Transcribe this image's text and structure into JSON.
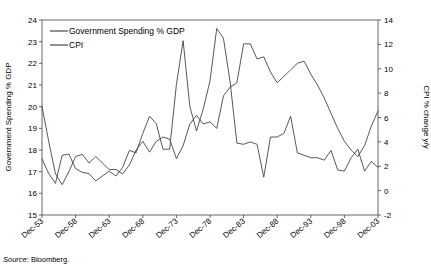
{
  "chart_data": {
    "type": "line",
    "title": "",
    "source": "Source: Bloomberg.",
    "source_prefix": "Source:",
    "source_value": " Bloomberg.",
    "grid": false,
    "legend_position": "top-left",
    "xlabel": "",
    "x_tick_labels": [
      "Dec-53",
      "Dec-58",
      "Dec-63",
      "Dec-68",
      "Dec-73",
      "Dec-78",
      "Dec-83",
      "Dec-88",
      "Dec-93",
      "Dec-98",
      "Dec-03"
    ],
    "x_tick_years": [
      1953,
      1958,
      1963,
      1968,
      1973,
      1978,
      1983,
      1988,
      1993,
      1998,
      2003
    ],
    "xlim": [
      1953,
      2003
    ],
    "left_axis": {
      "label": "Government Spending % GDP",
      "ylim": [
        15,
        24
      ],
      "ticks": [
        15,
        16,
        17,
        18,
        19,
        20,
        21,
        22,
        23,
        24
      ],
      "tick_labels": [
        "15",
        "16",
        "17",
        "18",
        "19",
        "20",
        "21",
        "22",
        "23",
        "24"
      ]
    },
    "right_axis": {
      "label": "CPI % change y/y",
      "ylim": [
        -2,
        14
      ],
      "ticks": [
        -2,
        0,
        2,
        4,
        6,
        8,
        10,
        12,
        14
      ],
      "tick_labels": [
        "-2",
        "0",
        "2",
        "4",
        "6",
        "8",
        "10",
        "12",
        "14"
      ]
    },
    "series": [
      {
        "name": "Government Spending % GDP",
        "axis": "left",
        "color": "#3a3a3a",
        "x": [
          1953,
          1954,
          1955,
          1956,
          1957,
          1958,
          1959,
          1960,
          1961,
          1962,
          1963,
          1964,
          1965,
          1966,
          1967,
          1968,
          1969,
          1970,
          1971,
          1972,
          1973,
          1974,
          1975,
          1976,
          1977,
          1978,
          1979,
          1980,
          1981,
          1982,
          1983,
          1984,
          1985,
          1986,
          1987,
          1988,
          1989,
          1990,
          1991,
          1992,
          1993,
          1994,
          1995,
          1996,
          1997,
          1998,
          1999,
          2000,
          2001,
          2002,
          2003
        ],
        "values": [
          20.0,
          18.4,
          16.9,
          16.4,
          17.0,
          17.7,
          17.8,
          17.4,
          17.7,
          17.4,
          17.1,
          17.1,
          16.9,
          17.3,
          18.0,
          18.4,
          17.9,
          18.4,
          18.6,
          18.5,
          17.6,
          18.2,
          19.2,
          19.6,
          19.2,
          19.3,
          19.0,
          20.5,
          20.9,
          21.1,
          22.9,
          22.9,
          22.2,
          22.3,
          21.6,
          21.1,
          21.4,
          21.7,
          22.0,
          22.1,
          21.5,
          21.0,
          20.4,
          19.7,
          19.0,
          18.4,
          18.0,
          17.7,
          18.2,
          19.1,
          19.8
        ],
        "notes": "Left-scale series. Starts near 20 in 1953, falls to ~16.4 by 1956, drifts 17-18.5 through the 1960s, rises through the 1970s, peaks ~23 in the early-to-mid 1980s, declines through the 1990s to ~17.7 around 2000, then rises to ~19.8 by 2003."
      },
      {
        "name": "CPI",
        "axis": "right",
        "color": "#3a3a3a",
        "x": [
          1953,
          1954,
          1955,
          1956,
          1957,
          1958,
          1959,
          1960,
          1961,
          1962,
          1963,
          1964,
          1965,
          1966,
          1967,
          1968,
          1969,
          1970,
          1971,
          1972,
          1973,
          1974,
          1975,
          1976,
          1977,
          1978,
          1979,
          1980,
          1981,
          1982,
          1983,
          1984,
          1985,
          1986,
          1987,
          1988,
          1989,
          1990,
          1991,
          1992,
          1993,
          1994,
          1995,
          1996,
          1997,
          1998,
          1999,
          2000,
          2001,
          2002,
          2003
        ],
        "values": [
          2.6,
          1.4,
          0.6,
          2.9,
          3.0,
          1.8,
          1.5,
          1.4,
          0.8,
          1.2,
          1.6,
          1.2,
          1.9,
          3.3,
          3.1,
          4.7,
          6.1,
          5.5,
          3.4,
          3.4,
          8.7,
          12.3,
          6.9,
          4.9,
          6.7,
          9.0,
          13.3,
          12.5,
          8.9,
          3.9,
          3.8,
          4.0,
          3.8,
          1.1,
          4.4,
          4.4,
          4.7,
          6.1,
          3.1,
          2.9,
          2.7,
          2.7,
          2.5,
          3.3,
          1.7,
          1.6,
          2.7,
          3.4,
          1.6,
          2.4,
          1.9
        ],
        "notes": "Right-scale series. Low and volatile 1-3% in the 1950s-60s, spikes to ~12 in 1974, dips to ~5 in 1976, surges to a peak ~13.3 around 1979-80, collapses to ~4 by 1983, a sharp trough ~1 in 1986, secondary peak ~6 around 1990, then settles 1.5-3.5% through the 1990s and early 2000s."
      }
    ],
    "legend": [
      {
        "label": "Government Spending % GDP",
        "color": "#3a3a3a"
      },
      {
        "label": "CPI",
        "color": "#3a3a3a"
      }
    ]
  }
}
